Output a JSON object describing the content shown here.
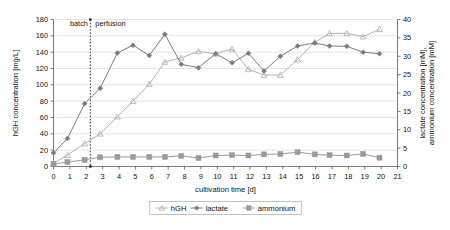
{
  "chart_data": {
    "type": "line",
    "title": "",
    "subtitle": "",
    "xlabel": "cultivation time [d]",
    "ylabel": "hGH concentration [mg/L]",
    "y2label_line1": "lactate concentration [mM],",
    "y2label_line2": "ammonium concentration [mM]",
    "xlim": [
      0,
      21
    ],
    "ylim": [
      0,
      180
    ],
    "y2lim": [
      0,
      40
    ],
    "xticks": [
      0,
      1,
      2,
      3,
      4,
      5,
      6,
      7,
      8,
      9,
      10,
      11,
      12,
      13,
      14,
      15,
      16,
      17,
      18,
      19,
      20,
      21
    ],
    "yticks": [
      0,
      20,
      40,
      60,
      80,
      100,
      120,
      140,
      160,
      180
    ],
    "y2ticks": [
      0,
      5,
      10,
      15,
      20,
      25,
      30,
      35,
      40
    ],
    "grid": "horizontal",
    "legend_position": "bottom-center",
    "annotations": [
      {
        "text": "batch",
        "x": 1.0,
        "y": 172
      },
      {
        "text": "perfusion",
        "x": 2.55,
        "y": 172
      }
    ],
    "vertical_divider": {
      "x": 2.25,
      "style": "dotted",
      "label": "batch/perfusion switch"
    },
    "series": [
      {
        "name": "hGH",
        "axis": "left",
        "unit": "mg/L",
        "color": "#b3b3b3",
        "marker": "triangle",
        "points": [
          {
            "x": 0.0,
            "y": 4
          },
          {
            "x": 0.85,
            "y": 14
          },
          {
            "x": 1.9,
            "y": 28
          },
          {
            "x": 2.85,
            "y": 40
          },
          {
            "x": 3.9,
            "y": 61
          },
          {
            "x": 4.85,
            "y": 80
          },
          {
            "x": 5.85,
            "y": 101
          },
          {
            "x": 6.8,
            "y": 128
          },
          {
            "x": 7.8,
            "y": 133
          },
          {
            "x": 8.85,
            "y": 141
          },
          {
            "x": 9.9,
            "y": 138
          },
          {
            "x": 10.9,
            "y": 144
          },
          {
            "x": 11.9,
            "y": 119
          },
          {
            "x": 12.85,
            "y": 112
          },
          {
            "x": 13.85,
            "y": 112
          },
          {
            "x": 14.9,
            "y": 131
          },
          {
            "x": 15.95,
            "y": 152
          },
          {
            "x": 16.85,
            "y": 163
          },
          {
            "x": 17.9,
            "y": 163
          },
          {
            "x": 18.9,
            "y": 159
          },
          {
            "x": 19.9,
            "y": 168
          }
        ]
      },
      {
        "name": "lactate",
        "axis": "right",
        "unit": "mM",
        "color": "#7b7b7b",
        "marker": "diamond",
        "points": [
          {
            "x": 0.0,
            "y": 3.7
          },
          {
            "x": 0.85,
            "y": 7.6
          },
          {
            "x": 1.9,
            "y": 17.1
          },
          {
            "x": 2.85,
            "y": 21.3
          },
          {
            "x": 3.9,
            "y": 30.9
          },
          {
            "x": 4.85,
            "y": 33.0
          },
          {
            "x": 5.85,
            "y": 30.2
          },
          {
            "x": 6.8,
            "y": 36.0
          },
          {
            "x": 7.8,
            "y": 27.8
          },
          {
            "x": 8.85,
            "y": 26.9
          },
          {
            "x": 9.9,
            "y": 30.7
          },
          {
            "x": 10.9,
            "y": 28.2
          },
          {
            "x": 11.9,
            "y": 30.8
          },
          {
            "x": 12.85,
            "y": 26.0
          },
          {
            "x": 13.85,
            "y": 30.0
          },
          {
            "x": 14.9,
            "y": 32.8
          },
          {
            "x": 15.95,
            "y": 33.6
          },
          {
            "x": 16.85,
            "y": 32.8
          },
          {
            "x": 17.9,
            "y": 32.7
          },
          {
            "x": 18.9,
            "y": 31.1
          },
          {
            "x": 19.9,
            "y": 30.7
          }
        ]
      },
      {
        "name": "ammonium",
        "axis": "right",
        "unit": "mM",
        "color": "#9a9a9a",
        "marker": "square",
        "points": [
          {
            "x": 0.0,
            "y": 0.7
          },
          {
            "x": 0.85,
            "y": 1.2
          },
          {
            "x": 1.9,
            "y": 1.8
          },
          {
            "x": 2.85,
            "y": 2.5
          },
          {
            "x": 3.9,
            "y": 2.6
          },
          {
            "x": 4.85,
            "y": 2.6
          },
          {
            "x": 5.85,
            "y": 2.6
          },
          {
            "x": 6.8,
            "y": 2.6
          },
          {
            "x": 7.8,
            "y": 2.9
          },
          {
            "x": 8.85,
            "y": 2.3
          },
          {
            "x": 9.9,
            "y": 3.0
          },
          {
            "x": 10.9,
            "y": 3.1
          },
          {
            "x": 11.9,
            "y": 3.0
          },
          {
            "x": 12.85,
            "y": 3.3
          },
          {
            "x": 13.85,
            "y": 3.4
          },
          {
            "x": 14.9,
            "y": 3.9
          },
          {
            "x": 15.95,
            "y": 3.3
          },
          {
            "x": 16.85,
            "y": 3.1
          },
          {
            "x": 17.9,
            "y": 3.0
          },
          {
            "x": 18.9,
            "y": 3.4
          },
          {
            "x": 19.9,
            "y": 2.4
          }
        ]
      }
    ]
  },
  "legend": {
    "items": [
      {
        "label": "hGH",
        "marker": "triangle",
        "color": "#b3b3b3"
      },
      {
        "label": "lactate",
        "marker": "diamond",
        "color": "#7b7b7b"
      },
      {
        "label": "ammonium",
        "marker": "square",
        "color": "#9a9a9a"
      }
    ]
  },
  "colors": {
    "hgh": "#b3b3b3",
    "lactate": "#7b7b7b",
    "ammonium": "#9a9a9a",
    "grid": "#d4d4d4",
    "axis": "#5a5a5a",
    "text": "#111111",
    "background": "#ffffff"
  }
}
